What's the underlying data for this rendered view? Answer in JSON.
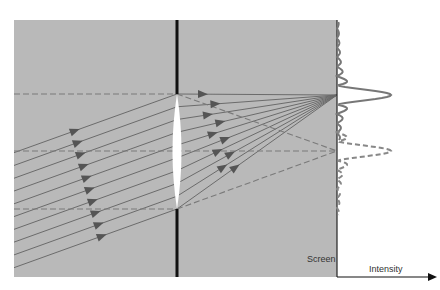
{
  "diagram": {
    "labels": {
      "screen": "Screen",
      "intensity": "Intensity"
    },
    "colors": {
      "background": "#b9b9b9",
      "ray": "#6b6b6b",
      "dashed_axis": "#7a7a7a",
      "aperture": "#111111",
      "lens": "#ffffff",
      "intensity_curve": "#777777",
      "axis": "#111111"
    },
    "elements": {
      "incident_rays": 10,
      "lens": "converging lens",
      "aperture_stop": "opaque barrier with opening",
      "focus_on_screen": "off-axis focal point",
      "intensity_profiles": [
        {
          "name": "oblique-beam-profile",
          "style": "solid",
          "description": "diffraction pattern centered on off-axis focus"
        },
        {
          "name": "on-axis-profile",
          "style": "dashed",
          "description": "diffraction pattern centered on optical axis"
        }
      ]
    }
  }
}
